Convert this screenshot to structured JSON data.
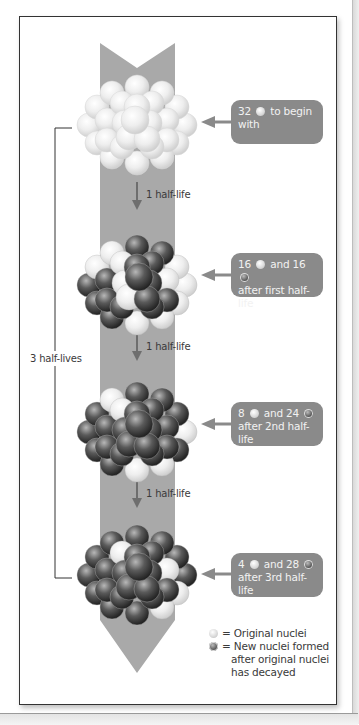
{
  "diagram": {
    "colors": {
      "arrow_band": "#a9a9a9",
      "label_box": "#8a8a8a",
      "label_text": "#f2f2f2",
      "original_nuclei": "#eeeeee",
      "new_nuclei": "#4a4a4a"
    },
    "stages": [
      {
        "original": 32,
        "new": 0,
        "label_parts": [
          "32",
          "to begin",
          "with"
        ]
      },
      {
        "original": 16,
        "new": 16,
        "label_parts": [
          "16",
          "and 16",
          "after first half-life"
        ]
      },
      {
        "original": 8,
        "new": 24,
        "label_parts": [
          "8",
          "and 24",
          "after 2nd half-life"
        ]
      },
      {
        "original": 4,
        "new": 28,
        "label_parts": [
          "4",
          "and 28",
          "after 3rd half-life"
        ]
      }
    ],
    "step_labels": [
      "1 half-life",
      "1 half-life",
      "1 half-life"
    ],
    "bracket_label": "3 half-lives",
    "legend": {
      "original": "= Original nuclei",
      "new_line1": "= New nuclei formed",
      "new_line2": "after original nuclei",
      "new_line3": "has decayed"
    }
  }
}
